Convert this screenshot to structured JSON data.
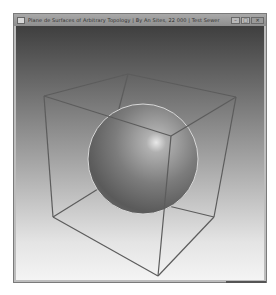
{
  "window": {
    "title": "Plane de Surfaces of Arbitrary Topology | By An Sites, 22 000 | Test Sewer",
    "controls": {
      "minimize": "–",
      "maximize": "□",
      "close": "✕"
    }
  },
  "scene": {
    "background": {
      "top_color": "#3f3f3f",
      "bottom_color": "#f4f4f4"
    },
    "objects": [
      {
        "type": "sphere",
        "shading": "smooth",
        "color": "#7a7a7a"
      },
      {
        "type": "wireframe-cube",
        "edge_color": "#5a5a5a"
      }
    ]
  }
}
